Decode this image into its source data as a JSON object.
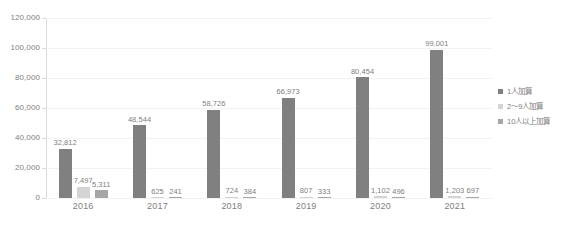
{
  "chart_data": {
    "type": "bar",
    "title": "",
    "subtitle": "",
    "xlabel": "",
    "ylabel": "",
    "ylim": [
      0,
      120000
    ],
    "ytick_labels": [
      "0",
      "20,000",
      "40,000",
      "60,000",
      "80,000",
      "100,000",
      "120,000"
    ],
    "ytick_values": [
      0,
      20000,
      40000,
      60000,
      80000,
      100000,
      120000
    ],
    "grid": "horizontal",
    "legend_position": "right",
    "categories": [
      "2016",
      "2017",
      "2018",
      "2019",
      "2020",
      "2021"
    ],
    "series": [
      {
        "name": "1人加算",
        "color": "#808080",
        "values": [
          32812,
          48544,
          58726,
          66973,
          80454,
          99001
        ],
        "labels": [
          "32,812",
          "48,544",
          "58,726",
          "66,973",
          "80,454",
          "99,001"
        ]
      },
      {
        "name": "2～9人加算",
        "color": "#d4d4d4",
        "values": [
          7497,
          625,
          724,
          807,
          1102,
          1203
        ],
        "labels": [
          "7,497",
          "625",
          "724",
          "807",
          "1,102",
          "1,203"
        ]
      },
      {
        "name": "10人以上加算",
        "color": "#a6a6a6",
        "values": [
          5311,
          241,
          384,
          333,
          496,
          697
        ],
        "labels": [
          "5,311",
          "241",
          "384",
          "333",
          "496",
          "697"
        ]
      }
    ]
  },
  "legend": {
    "items": [
      {
        "label": "1人加算",
        "color": "#808080"
      },
      {
        "label": "2～9人加算",
        "color": "#d4d4d4"
      },
      {
        "label": "10人以上加算",
        "color": "#a6a6a6"
      }
    ]
  },
  "axes": {
    "y": {
      "ticks": [
        "120,000",
        "100,000",
        "80,000",
        "60,000",
        "40,000",
        "20,000",
        "0"
      ]
    },
    "x": {
      "ticks": [
        "2016",
        "2017",
        "2018",
        "2019",
        "2020",
        "2021"
      ]
    }
  },
  "colors": {
    "series_1": "#808080",
    "series_2": "#d4d4d4",
    "series_3": "#a6a6a6",
    "gridline": "#f2f2f2",
    "axis": "#d9d9d9",
    "text": "#808080",
    "background": "#ffffff"
  }
}
